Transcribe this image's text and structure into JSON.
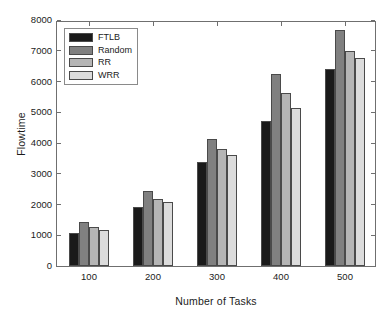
{
  "chart_data": {
    "type": "bar",
    "title": "",
    "subtitle": "",
    "xlabel": "Number of Tasks",
    "ylabel": "Flowtime",
    "categories": [
      "100",
      "200",
      "300",
      "400",
      "500"
    ],
    "series": [
      {
        "name": "FTLB",
        "color": "#1a1a1a",
        "values": [
          1060,
          1930,
          3390,
          4720,
          6410
        ]
      },
      {
        "name": "Random",
        "color": "#808080",
        "values": [
          1430,
          2440,
          4140,
          6250,
          7660
        ]
      },
      {
        "name": "RR",
        "color": "#b5b5b5",
        "values": [
          1280,
          2180,
          3820,
          5620,
          6990
        ]
      },
      {
        "name": "WRR",
        "color": "#dcdcdc",
        "values": [
          1180,
          2080,
          3620,
          5140,
          6770
        ]
      }
    ],
    "ylim": [
      0,
      8000
    ],
    "yticks": [
      0,
      1000,
      2000,
      3000,
      4000,
      5000,
      6000,
      7000,
      8000
    ],
    "ytick_labels": [
      "0",
      "1000",
      "2000",
      "3000",
      "4000",
      "5000",
      "6000",
      "7000",
      "8000"
    ],
    "xtick_labels": [
      "100",
      "200",
      "300",
      "400",
      "500"
    ],
    "grid": false,
    "legend_position": "top-left",
    "legend_entries": [
      "FTLB",
      "Random",
      "RR",
      "WRR"
    ],
    "axis_color": "#6f6f6f",
    "bar_edge_color": "#4a4a4a",
    "background": "#ffffff"
  }
}
